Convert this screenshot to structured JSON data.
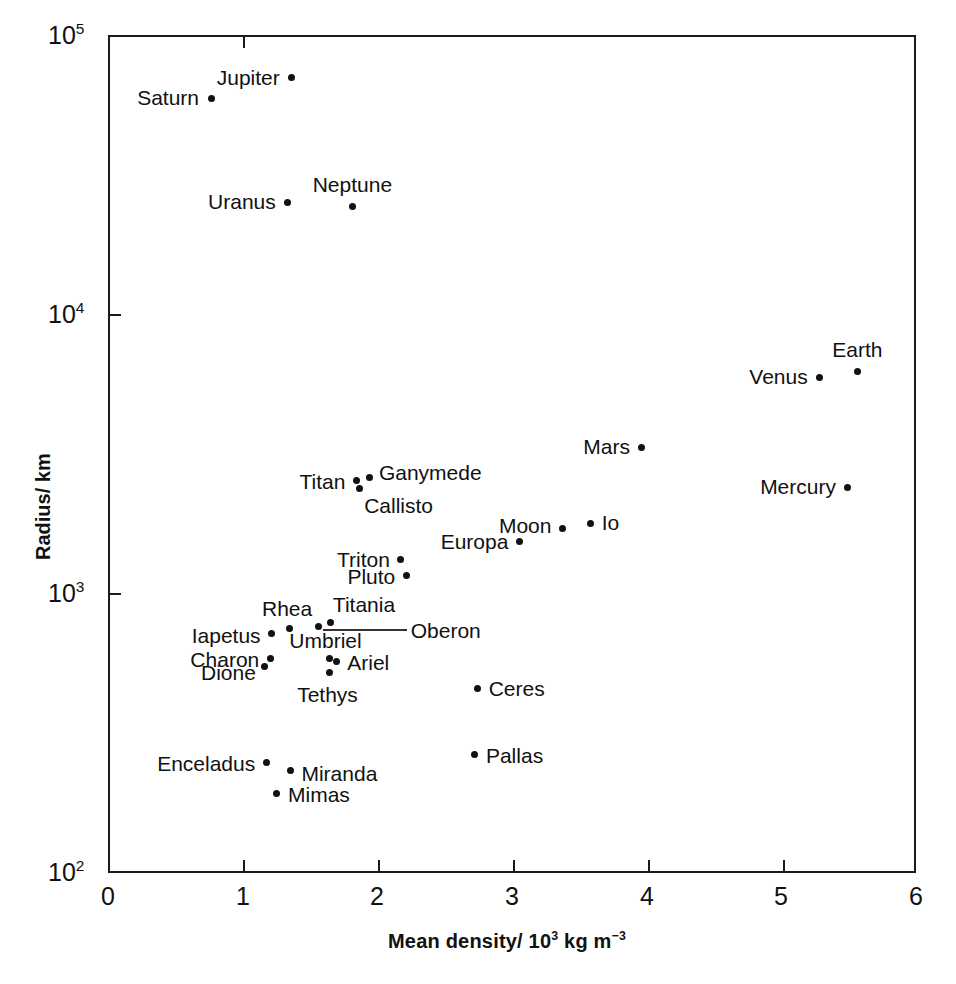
{
  "figure": {
    "title": "",
    "background": "#ffffff",
    "point_color": "#111111",
    "axis_color": "#1a1a1a"
  },
  "axes": {
    "x": {
      "label": "Mean density/ 10",
      "label_sup": "3",
      "label_tail": " kg m",
      "label_tail_sup": "−3",
      "ticks": [
        "0",
        "1",
        "2",
        "3",
        "4",
        "5",
        "6"
      ],
      "min": 0,
      "max": 6
    },
    "y": {
      "label": "Radius/ km",
      "ticks": [
        "10",
        "10",
        "10",
        "10"
      ],
      "tick_exponents": [
        "5",
        "4",
        "3",
        "2"
      ],
      "min": 100,
      "max": 100000,
      "scale": "log"
    }
  },
  "chart_data": {
    "type": "scatter",
    "title": "",
    "xlabel": "Mean density/ 10^3 kg m^-3",
    "ylabel": "Radius/ km",
    "xlim": [
      0,
      6
    ],
    "ylim": [
      100,
      100000
    ],
    "yscale": "log",
    "xscale": "linear",
    "grid": false,
    "legend": null,
    "points": [
      {
        "name": "Jupiter",
        "x": 1.35,
        "y": 71500,
        "label_pos": "r"
      },
      {
        "name": "Saturn",
        "x": 0.75,
        "y": 60300,
        "label_pos": "r"
      },
      {
        "name": "Uranus",
        "x": 1.32,
        "y": 25600,
        "label_pos": "r"
      },
      {
        "name": "Neptune",
        "x": 1.8,
        "y": 24800,
        "label_pos": "above"
      },
      {
        "name": "Earth",
        "x": 5.55,
        "y": 6370,
        "label_pos": "above"
      },
      {
        "name": "Venus",
        "x": 5.27,
        "y": 6050,
        "label_pos": "r"
      },
      {
        "name": "Mars",
        "x": 3.95,
        "y": 3400,
        "label_pos": "r"
      },
      {
        "name": "Mercury",
        "x": 5.48,
        "y": 2440,
        "label_pos": "r"
      },
      {
        "name": "Ganymede",
        "x": 1.93,
        "y": 2640,
        "label_pos": "l"
      },
      {
        "name": "Titan",
        "x": 1.83,
        "y": 2575,
        "label_pos": "r"
      },
      {
        "name": "Callisto",
        "x": 1.85,
        "y": 2410,
        "label_pos": "below-l"
      },
      {
        "name": "Io",
        "x": 3.57,
        "y": 1815,
        "label_pos": "l"
      },
      {
        "name": "Moon",
        "x": 3.36,
        "y": 1738,
        "label_pos": "r"
      },
      {
        "name": "Europa",
        "x": 3.04,
        "y": 1565,
        "label_pos": "r"
      },
      {
        "name": "Triton",
        "x": 2.16,
        "y": 1350,
        "label_pos": "r"
      },
      {
        "name": "Pluto",
        "x": 2.2,
        "y": 1180,
        "label_pos": "r"
      },
      {
        "name": "Titania",
        "x": 1.64,
        "y": 800,
        "label_pos": "above"
      },
      {
        "name": "Oberon",
        "x": 1.55,
        "y": 775,
        "label_pos": "leader"
      },
      {
        "name": "Rhea",
        "x": 1.33,
        "y": 765,
        "label_pos": "above"
      },
      {
        "name": "Iapetus",
        "x": 1.2,
        "y": 730,
        "label_pos": "r"
      },
      {
        "name": "Umbriel",
        "x": 1.63,
        "y": 595,
        "label_pos": "above"
      },
      {
        "name": "Ariel",
        "x": 1.68,
        "y": 580,
        "label_pos": "l"
      },
      {
        "name": "Charon",
        "x": 1.19,
        "y": 595,
        "label_pos": "r"
      },
      {
        "name": "Tethys",
        "x": 1.63,
        "y": 530,
        "label_pos": "below"
      },
      {
        "name": "Dione",
        "x": 1.15,
        "y": 560,
        "label_pos": "r"
      },
      {
        "name": "Ceres",
        "x": 2.73,
        "y": 466,
        "label_pos": "l"
      },
      {
        "name": "Pallas",
        "x": 2.71,
        "y": 270,
        "label_pos": "l"
      },
      {
        "name": "Enceladus",
        "x": 1.16,
        "y": 252,
        "label_pos": "r"
      },
      {
        "name": "Miranda",
        "x": 1.34,
        "y": 236,
        "label_pos": "l"
      },
      {
        "name": "Mimas",
        "x": 1.24,
        "y": 196,
        "label_pos": "l"
      }
    ]
  }
}
